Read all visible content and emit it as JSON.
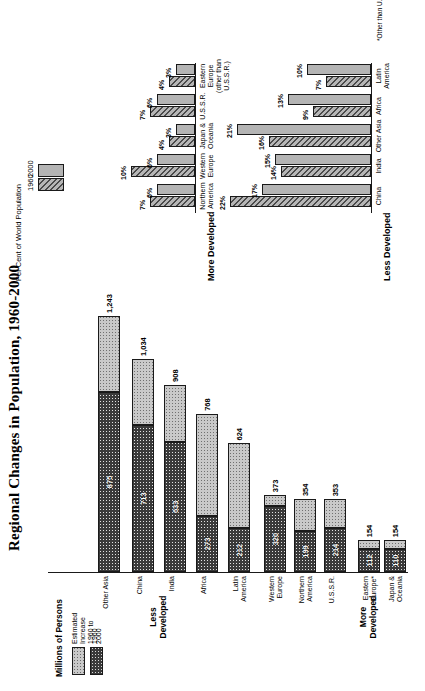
{
  "page": {
    "title": "Regional Changes in Population, 1960-2000"
  },
  "left_chart": {
    "axis_label": "Millions of Persons",
    "legend": [
      {
        "label": "Estimated Increase\n1960 to 2000",
        "line1": "Estimated Increase",
        "line2": "1960 to 2000",
        "swatch": "estimated-increase-swatch"
      },
      {
        "label": "1960",
        "line1": "1960",
        "line2": "",
        "swatch": "nineteen-sixty-swatch"
      }
    ],
    "groups": [
      {
        "name": "More Developed",
        "line1": "More",
        "line2": "Developed"
      },
      {
        "name": "Less Developed",
        "line1": "Less",
        "line2": "Developed"
      }
    ]
  },
  "right_chart": {
    "title": "Per Cent of World Population",
    "legend": [
      {
        "label": "1960"
      },
      {
        "label": "2000"
      }
    ],
    "groups": [
      {
        "name": "More Developed"
      },
      {
        "name": "Less Developed"
      }
    ],
    "footnote": "*Other than U.S.S.R."
  },
  "chart_data": [
    {
      "type": "bar",
      "orientation": "horizontal",
      "stacked": true,
      "title": "Regional Changes in Population, 1960-2000",
      "xlabel": "Millions of Persons",
      "ylabel": "",
      "xlim": [
        0,
        1300
      ],
      "grid": false,
      "legend_position": "top-left",
      "series": [
        {
          "name": "1960",
          "values": [
            110,
            112,
            214,
            199,
            320,
            212,
            273,
            633,
            713,
            875
          ]
        },
        {
          "name": "Estimated Increase 1960 to 2000",
          "values": [
            44,
            42,
            139,
            155,
            53,
            412,
            495,
            275,
            321,
            368
          ]
        }
      ],
      "categories": [
        "Japan & Oceania",
        "Eastern Europe",
        "U.S.S.R.",
        "Northern America",
        "Western Europe",
        "Latin America",
        "Africa",
        "India",
        "China",
        "Other Asia"
      ],
      "category_lines": [
        [
          "Japan &",
          "Oceania"
        ],
        [
          "Eastern",
          "Europe*"
        ],
        [
          "U.S.S.R.",
          ""
        ],
        [
          "Northern",
          "America"
        ],
        [
          "Western",
          "Europe"
        ],
        [
          "Latin",
          "America"
        ],
        [
          "Africa",
          ""
        ],
        [
          "India",
          ""
        ],
        [
          "China",
          ""
        ],
        [
          "Other Asia",
          ""
        ]
      ],
      "totals": [
        154,
        154,
        353,
        354,
        373,
        624,
        768,
        908,
        1034,
        1243
      ],
      "total_labels": [
        "154",
        "154",
        "353",
        "354",
        "373",
        "624",
        "768",
        "908",
        "1,034",
        "1,243"
      ],
      "segment_labels": [
        "110",
        "112",
        "214",
        "199",
        "320",
        "212",
        "273",
        "633",
        "713",
        "875"
      ],
      "group_assignment": [
        "More Developed",
        "More Developed",
        "More Developed",
        "More Developed",
        "More Developed",
        "Less Developed",
        "Less Developed",
        "Less Developed",
        "Less Developed",
        "Less Developed"
      ]
    },
    {
      "type": "bar",
      "orientation": "vertical",
      "stacked": false,
      "title": "Per Cent of World Population",
      "xlabel": "",
      "ylabel": "",
      "ylim": [
        0,
        24
      ],
      "grid": false,
      "legend_position": "top-right",
      "panels": [
        {
          "name": "More Developed",
          "categories": [
            "Northern America",
            "Western Europe",
            "Japan & Oceania",
            "U.S.S.R.",
            "Eastern Europe (other than U.S.S.R.)"
          ],
          "category_lines": [
            [
              "Northern",
              "America",
              ""
            ],
            [
              "Western",
              "Europe",
              ""
            ],
            [
              "Japan &",
              "Oceania",
              ""
            ],
            [
              "U.S.S.R.",
              "",
              ""
            ],
            [
              "Eastern Europe",
              "(other than U.S.S.R.)",
              ""
            ]
          ],
          "series": [
            {
              "name": "1960",
              "values": [
                7,
                10,
                4,
                7,
                4
              ],
              "labels": [
                "7%",
                "10%",
                "4%",
                "7%",
                "4%"
              ]
            },
            {
              "name": "2000",
              "values": [
                6,
                6,
                3,
                6,
                3
              ],
              "labels": [
                "6%",
                "6%",
                "3%",
                "6%",
                "3%"
              ]
            }
          ]
        },
        {
          "name": "Less Developed",
          "categories": [
            "China",
            "India",
            "Other Asia",
            "Africa",
            "Latin America"
          ],
          "category_lines": [
            [
              "China",
              ""
            ],
            [
              "India",
              ""
            ],
            [
              "Other Asia",
              ""
            ],
            [
              "Africa",
              ""
            ],
            [
              "Latin",
              "America"
            ]
          ],
          "series": [
            {
              "name": "1960",
              "values": [
                22,
                14,
                16,
                9,
                7
              ],
              "labels": [
                "22%",
                "14%",
                "16%",
                "9%",
                "7%"
              ]
            },
            {
              "name": "2000",
              "values": [
                17,
                15,
                21,
                13,
                10
              ],
              "labels": [
                "17%",
                "15%",
                "21%",
                "13%",
                "10%"
              ]
            }
          ]
        }
      ],
      "footnote": "*Other than U.S.S.R."
    }
  ]
}
